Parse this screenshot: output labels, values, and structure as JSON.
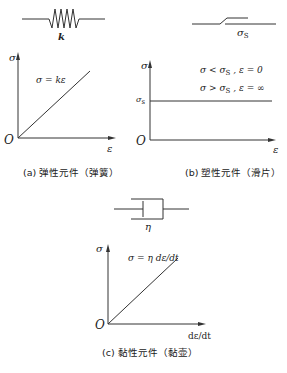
{
  "panels": {
    "a": {
      "element_symbol": "spring",
      "element_label": "k",
      "y_axis": "σ",
      "x_axis": "ε",
      "origin": "O",
      "equation": "σ = kε",
      "caption": "(a) 弹性元件（弹簧）"
    },
    "b": {
      "element_symbol": "slider",
      "element_label": "σ",
      "element_label_sub": "S",
      "y_axis": "σ",
      "x_axis": "ε",
      "origin": "O",
      "y_tick": "σ",
      "y_tick_sub": "s",
      "cond1": "σ < σ",
      "cond1_sub": "S",
      "cond1_tail": " , ε = 0",
      "cond2": "σ > σ",
      "cond2_sub": "S",
      "cond2_tail": " , ε = ∞",
      "caption": "(b) 塑性元件（滑片）"
    },
    "c": {
      "element_symbol": "dashpot",
      "element_label": "η",
      "y_axis": "σ",
      "x_axis": "dε/dt",
      "origin": "O",
      "equation": "σ = η dε/dt",
      "caption": "(c) 黏性元件（黏壶）"
    }
  }
}
